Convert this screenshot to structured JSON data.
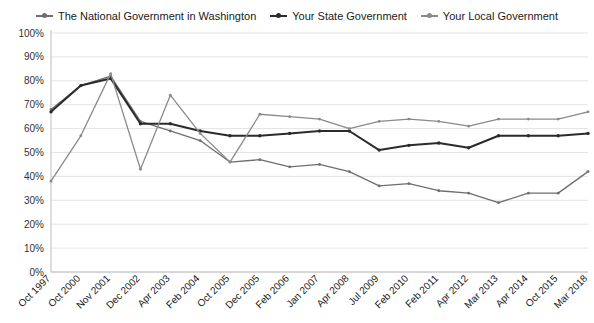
{
  "chart_data": {
    "type": "line",
    "title": "",
    "subtitle": "",
    "xlabel": "",
    "ylabel": "",
    "ylim": [
      0,
      100
    ],
    "yticks": [
      "0%",
      "10%",
      "20%",
      "30%",
      "40%",
      "50%",
      "60%",
      "70%",
      "80%",
      "90%",
      "100%"
    ],
    "ytick_values": [
      0,
      10,
      20,
      30,
      40,
      50,
      60,
      70,
      80,
      90,
      100
    ],
    "grid": true,
    "legend_position": "top",
    "categories": [
      "Oct 1997",
      "Oct 2000",
      "Nov 2001",
      "Dec 2002",
      "Apr 2003",
      "Feb 2004",
      "Oct 2005",
      "Dec 2005",
      "Feb 2006",
      "Jan 2007",
      "Apr 2008",
      "Jul 2009",
      "Feb 2010",
      "Feb 2011",
      "Apr 2012",
      "Mar 2013",
      "Apr 2014",
      "Oct 2015",
      "Mar 2018"
    ],
    "series": [
      {
        "name": "The National Government in Washington",
        "color": "#6e6e6e",
        "values": [
          68,
          78,
          82,
          63,
          59,
          55,
          46,
          47,
          44,
          45,
          42,
          36,
          37,
          34,
          33,
          29,
          33,
          33,
          42
        ]
      },
      {
        "name": "Your State Government",
        "color": "#2b2b2b",
        "values": [
          67,
          78,
          81,
          62,
          62,
          59,
          57,
          57,
          58,
          59,
          59,
          51,
          53,
          54,
          52,
          57,
          57,
          57,
          58
        ]
      },
      {
        "name": "Your Local Government",
        "color": "#8a8a8a",
        "values": [
          38,
          57,
          83,
          43,
          74,
          58,
          46,
          66,
          65,
          64,
          60,
          63,
          64,
          63,
          61,
          64,
          64,
          64,
          67
        ]
      }
    ]
  }
}
